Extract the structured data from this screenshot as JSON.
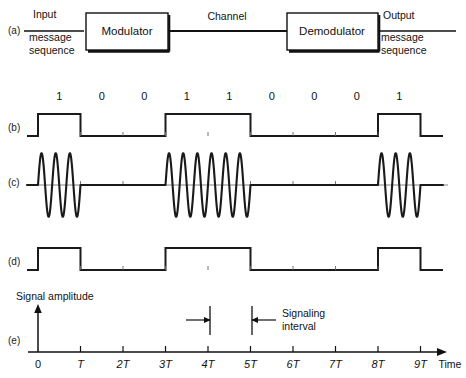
{
  "figure": {
    "rows": [
      {
        "key": "a",
        "label": "(a)"
      },
      {
        "key": "b",
        "label": "(b)"
      },
      {
        "key": "c",
        "label": "(c)"
      },
      {
        "key": "d",
        "label": "(d)"
      },
      {
        "key": "e",
        "label": "(e)"
      }
    ]
  },
  "block_diagram": {
    "input_label_line1": "Input",
    "input_label_line2": "message",
    "input_label_line3": "sequence",
    "modulator_label": "Modulator",
    "channel_label": "Channel",
    "demodulator_label": "Demodulator",
    "output_label_line1": "Output",
    "output_label_line2": "message",
    "output_label_line3": "sequence"
  },
  "axis": {
    "amplitude_label": "Signal amplitude",
    "time_label": "Time",
    "ticks": [
      "0",
      "T",
      "2T",
      "3T",
      "4T",
      "5T",
      "6T",
      "7T",
      "8T",
      "9T"
    ],
    "tick_values": [
      0,
      1,
      2,
      3,
      4,
      5,
      6,
      7,
      8,
      9
    ],
    "signaling_interval_label_line1": "Signaling",
    "signaling_interval_label_line2": "interval",
    "signaling_interval_start": 4,
    "signaling_interval_end": 5
  },
  "chart_data": {
    "type": "line",
    "xlabel": "Time",
    "ylabel": "Signal amplitude",
    "xlim": [
      0,
      9
    ],
    "ylim": [
      -1,
      1
    ],
    "grid": false,
    "xtick_labels": [
      "0",
      "T",
      "2T",
      "3T",
      "4T",
      "5T",
      "6T",
      "7T",
      "8T",
      "9T"
    ],
    "xtick_values": [
      0,
      1,
      2,
      3,
      4,
      5,
      6,
      7,
      8,
      9
    ],
    "bit_sequence": [
      1,
      0,
      0,
      1,
      1,
      0,
      0,
      0,
      1
    ],
    "bit_interval": "T",
    "carrier_cycles_per_bit": 3,
    "series": [
      {
        "name": "(b) input message sequence",
        "type": "square",
        "values": [
          1,
          0,
          0,
          1,
          1,
          0,
          0,
          0,
          1
        ],
        "levels": [
          0,
          1
        ]
      },
      {
        "name": "(c) modulated wave",
        "type": "ask-burst",
        "values": [
          1,
          0,
          0,
          1,
          1,
          0,
          0,
          0,
          1
        ],
        "bursts": [
          {
            "start": 0,
            "end": 1,
            "cycles": 3
          },
          {
            "start": 3,
            "end": 5,
            "cycles": 6
          },
          {
            "start": 8,
            "end": 9,
            "cycles": 3
          }
        ]
      },
      {
        "name": "(d) output message sequence",
        "type": "square",
        "values": [
          1,
          0,
          0,
          1,
          1,
          0,
          0,
          0,
          1
        ],
        "levels": [
          0,
          1
        ]
      }
    ],
    "annotations": [
      {
        "text": "Signaling interval",
        "x_start": 4,
        "x_end": 5
      }
    ]
  },
  "colors": {
    "ink": "#111111",
    "trace": "#1a1a1a",
    "axis": "#222222"
  }
}
